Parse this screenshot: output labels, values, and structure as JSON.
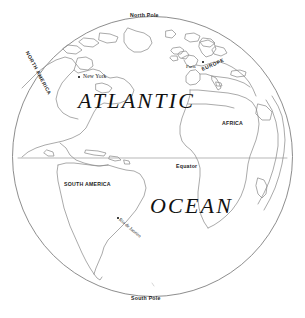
{
  "map": {
    "kind": "globe-orthographic-projection",
    "title_primary": "ATLANTIC",
    "title_secondary": "OCEAN",
    "background_color": "#ffffff",
    "coastline_color": "#8a8a8a",
    "globe_outline_color": "#777777",
    "label_color": "#1a1a1a"
  },
  "poles": {
    "north": "North Pole",
    "south": "South Pole"
  },
  "lines": {
    "equator_label": "Equator"
  },
  "continents": [
    {
      "name": "NORTH AMERICA"
    },
    {
      "name": "SOUTH AMERICA"
    },
    {
      "name": "EUROPE"
    },
    {
      "name": "AFRICA"
    }
  ],
  "cities": [
    {
      "name": "New York"
    },
    {
      "name": "Paris"
    },
    {
      "name": "Rio de Janeiro"
    }
  ]
}
